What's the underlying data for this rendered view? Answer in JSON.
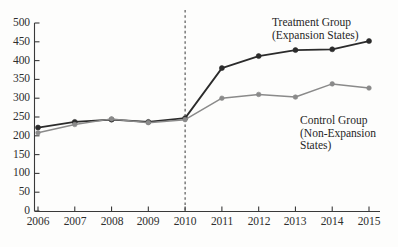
{
  "chart_data": {
    "type": "line",
    "title": "",
    "subtitle": "",
    "xlabel": "",
    "ylabel": "",
    "x": [
      2006,
      2007,
      2008,
      2009,
      2010,
      2011,
      2012,
      2013,
      2014,
      2015
    ],
    "categories": [
      "2006",
      "2007",
      "2008",
      "2009",
      "2010",
      "2011",
      "2012",
      "2013",
      "2014",
      "2015"
    ],
    "xlim": [
      2006,
      2015
    ],
    "ylim": [
      0,
      500
    ],
    "yticks": [
      0,
      50,
      100,
      150,
      200,
      250,
      300,
      350,
      400,
      450,
      500
    ],
    "ytick_labels": [
      "0",
      "50",
      "100",
      "150",
      "200",
      "250",
      "300",
      "350",
      "400",
      "450",
      "500"
    ],
    "grid": false,
    "legend_position": "inline-annotation",
    "series": [
      {
        "name": "Treatment Group (Expansion States)",
        "label_line_1": "Treatment Group",
        "label_line_2": "(Expansion States)",
        "color": "#2b2b2b",
        "marker": "circle",
        "values": [
          222,
          237,
          243,
          237,
          247,
          380,
          412,
          428,
          430,
          452
        ]
      },
      {
        "name": "Control Group (Non-Expansion States)",
        "label_line_1": "Control Group",
        "label_line_2": "(Non-Expansion",
        "label_line_3": "States)",
        "color": "#8a8a8a",
        "marker": "circle",
        "values": [
          208,
          230,
          245,
          235,
          243,
          300,
          310,
          303,
          338,
          327
        ]
      }
    ],
    "annotations": [
      {
        "name": "policy-cutoff-line",
        "type": "vline",
        "x": 2010,
        "style": "dashed",
        "color": "#4a4a4a"
      }
    ]
  }
}
